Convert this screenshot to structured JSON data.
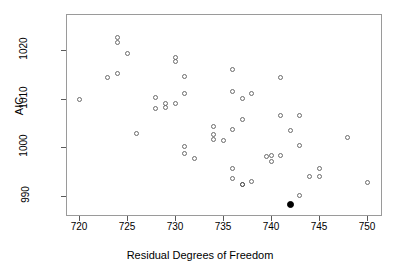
{
  "chart_data": {
    "type": "scatter",
    "title": "",
    "xlabel": "Residual Degrees of Freedom",
    "ylabel": "AIC",
    "xlim": [
      718.6,
      751.5
    ],
    "ylim": [
      986.5,
      1024.6
    ],
    "xticks": [
      720,
      725,
      730,
      735,
      740,
      745,
      750
    ],
    "yticks": [
      990,
      1000,
      1010,
      1020
    ],
    "grid": false,
    "legend": null,
    "marker_open_color": "#6b6b6b",
    "marker_filled_color": "#000000",
    "frame_color": "#9a9a9a",
    "points": [
      {
        "x": 724.0,
        "y": 1022.6,
        "style": "open"
      },
      {
        "x": 724.0,
        "y": 1021.5,
        "style": "open"
      },
      {
        "x": 725.0,
        "y": 1019.2,
        "style": "open"
      },
      {
        "x": 723.0,
        "y": 1014.4,
        "style": "open"
      },
      {
        "x": 724.0,
        "y": 1015.2,
        "style": "open"
      },
      {
        "x": 720.0,
        "y": 1009.7,
        "style": "open"
      },
      {
        "x": 730.0,
        "y": 1018.4,
        "style": "open"
      },
      {
        "x": 730.0,
        "y": 1017.6,
        "style": "open"
      },
      {
        "x": 731.0,
        "y": 1014.6,
        "style": "open"
      },
      {
        "x": 728.0,
        "y": 1010.3,
        "style": "open"
      },
      {
        "x": 731.0,
        "y": 1011.0,
        "style": "open"
      },
      {
        "x": 728.0,
        "y": 1008.0,
        "style": "open"
      },
      {
        "x": 729.0,
        "y": 1008.9,
        "style": "open"
      },
      {
        "x": 729.0,
        "y": 1008.2,
        "style": "open"
      },
      {
        "x": 730.0,
        "y": 1008.9,
        "style": "open"
      },
      {
        "x": 726.0,
        "y": 1002.7,
        "style": "open"
      },
      {
        "x": 731.0,
        "y": 1000.2,
        "style": "open"
      },
      {
        "x": 731.0,
        "y": 998.6,
        "style": "open"
      },
      {
        "x": 732.0,
        "y": 997.6,
        "style": "open"
      },
      {
        "x": 734.0,
        "y": 1004.3,
        "style": "open"
      },
      {
        "x": 734.0,
        "y": 1002.6,
        "style": "open"
      },
      {
        "x": 734.0,
        "y": 1001.6,
        "style": "open"
      },
      {
        "x": 735.0,
        "y": 1001.4,
        "style": "open"
      },
      {
        "x": 736.0,
        "y": 1016.0,
        "style": "open"
      },
      {
        "x": 736.0,
        "y": 1011.4,
        "style": "open"
      },
      {
        "x": 737.0,
        "y": 1009.9,
        "style": "open"
      },
      {
        "x": 738.0,
        "y": 1011.1,
        "style": "open"
      },
      {
        "x": 737.0,
        "y": 1005.6,
        "style": "open"
      },
      {
        "x": 736.0,
        "y": 1003.7,
        "style": "open"
      },
      {
        "x": 736.0,
        "y": 995.6,
        "style": "open"
      },
      {
        "x": 736.0,
        "y": 993.5,
        "style": "open"
      },
      {
        "x": 737.0,
        "y": 992.3,
        "style": "open",
        "bold": true
      },
      {
        "x": 738.0,
        "y": 992.8,
        "style": "open"
      },
      {
        "x": 739.5,
        "y": 998.1,
        "style": "open"
      },
      {
        "x": 740.0,
        "y": 997.0,
        "style": "open"
      },
      {
        "x": 740.0,
        "y": 998.2,
        "style": "open"
      },
      {
        "x": 741.0,
        "y": 998.3,
        "style": "open"
      },
      {
        "x": 741.0,
        "y": 1014.4,
        "style": "open"
      },
      {
        "x": 741.0,
        "y": 1006.4,
        "style": "open"
      },
      {
        "x": 743.0,
        "y": 1006.5,
        "style": "open"
      },
      {
        "x": 742.0,
        "y": 1003.3,
        "style": "open"
      },
      {
        "x": 743.0,
        "y": 1000.4,
        "style": "open"
      },
      {
        "x": 744.0,
        "y": 993.9,
        "style": "open"
      },
      {
        "x": 745.0,
        "y": 995.5,
        "style": "open"
      },
      {
        "x": 745.0,
        "y": 993.9,
        "style": "open"
      },
      {
        "x": 748.0,
        "y": 1001.9,
        "style": "open"
      },
      {
        "x": 750.0,
        "y": 992.6,
        "style": "open"
      },
      {
        "x": 743.0,
        "y": 989.9,
        "style": "open"
      },
      {
        "x": 742.0,
        "y": 988.2,
        "style": "filled"
      }
    ]
  }
}
